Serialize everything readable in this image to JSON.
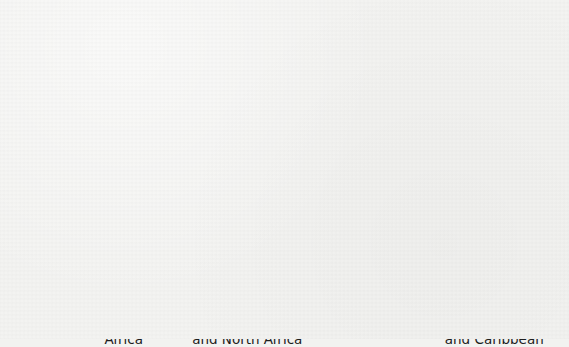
{
  "chart_data": {
    "type": "bar",
    "title": "",
    "subtitle": "",
    "xlabel": "",
    "ylabel": "Percent",
    "ylim": [
      0,
      60
    ],
    "ytick_labels": [
      "60",
      "50",
      "40",
      "30",
      "20",
      "10",
      "0"
    ],
    "ytick_values": [
      60,
      50,
      40,
      30,
      20,
      10,
      0
    ],
    "grid": true,
    "legend": "none",
    "categories": [
      "Sub-Saharan\nAfrica",
      "Middle East\nand North Africa",
      "South Asia",
      "Latin America\nand Caribbean"
    ],
    "values": [
      42,
      23,
      52.5,
      18.5
    ],
    "bar_color": "#4b4b4b",
    "frame_color": "#3b3b3b",
    "background_color": "#f3f3f1"
  },
  "axes": {
    "y_title": "Percent"
  },
  "title_sliver": {
    "text": "Poverty Headcount"
  }
}
